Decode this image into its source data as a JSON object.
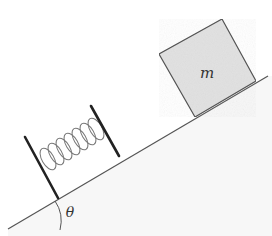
{
  "diagram": {
    "type": "physics-incline-spring-block",
    "labels": {
      "mass": "m",
      "angle": "θ"
    },
    "colors": {
      "background": "#ffffff",
      "line": "#555555",
      "plate": "#222222",
      "spring": "#777777",
      "block_fill": "#e3e3e3",
      "block_stroke": "#555555",
      "ground_fill": "#f6f6f6"
    },
    "elements": [
      {
        "id": "incline",
        "description": "Inclined plane surface at angle theta"
      },
      {
        "id": "spring",
        "description": "Spring between two plates resting on the incline"
      },
      {
        "id": "block",
        "description": "Block of mass m on the incline"
      },
      {
        "id": "angle-arc",
        "description": "Arc marking the incline angle theta"
      }
    ]
  }
}
